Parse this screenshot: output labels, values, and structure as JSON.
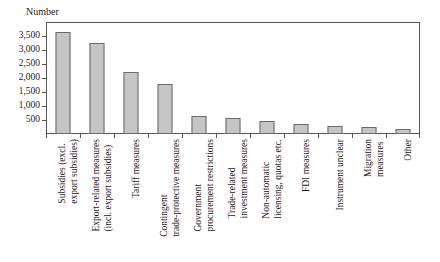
{
  "chart_data": {
    "type": "bar",
    "title": "",
    "ylabel": "Number",
    "xlabel": "",
    "ylim": [
      0,
      4000
    ],
    "yticks": [
      500,
      1000,
      1500,
      2000,
      2500,
      3000,
      3500
    ],
    "ytick_labels": [
      "500",
      "1,000",
      "1,500",
      "2,000",
      "2,500",
      "3,000",
      "3,500"
    ],
    "grid": false,
    "legend": null,
    "bar_color": "#c6c6c6",
    "bar_edge_color": "#6b6b6b",
    "categories": [
      "Subsidies (excl.\nexport subsidies)",
      "Export-related measures\n(incl. export subsidies)",
      "Tariff measures",
      "Contingent\ntrade-protective measures",
      "Government\nprocurement restrictions",
      "Trade-related\ninvestment measures",
      "Non-automatic\nlicensing, quotas etc.",
      "FDI measures",
      "Instrument unclear",
      "Migration\nmeasures",
      "Other"
    ],
    "values": [
      3650,
      3250,
      2220,
      1800,
      630,
      570,
      450,
      370,
      270,
      260,
      180
    ]
  }
}
